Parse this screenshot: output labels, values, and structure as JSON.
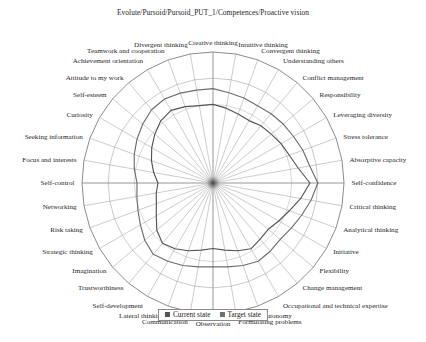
{
  "chart_title": "Evolute/Pursoid/Pursoid_PUT_1/Competences/Proactive vision",
  "legend": {
    "current_label": "Current state",
    "target_label": "Target state",
    "current_color": "#555555",
    "target_color": "#6e6e6e"
  },
  "colors": {
    "grid": "#8c8c8c",
    "spoke": "#909090",
    "outer_ring": "#6f6f6f",
    "axis_highlight": "#9a9a9a",
    "text": "#1b1b1b",
    "background": "#ffffff"
  },
  "chart_data": {
    "type": "radar",
    "title": "Evolute/Pursoid/Pursoid_PUT_1/Competences/Proactive vision",
    "xlabel": "",
    "ylabel": "",
    "rlim": [
      0,
      1
    ],
    "grid": true,
    "rings": 5,
    "legend_position": "bottom",
    "categories": [
      "Creative thinking",
      "Intuitive thinking",
      "Convergent thinking",
      "Understanding others",
      "Conflict management",
      "Responsibility",
      "Leveraging diversity",
      "Stress tolerance",
      "Absorptive capacity",
      "Self-confidence",
      "Critical thinking",
      "Analytical thinking",
      "Initiative",
      "Flexibility",
      "Change management",
      "Occupational and technical expertise",
      "Autonomy",
      "Formulating problems",
      "Observation",
      "Communication",
      "Lateral thinking",
      "Self-development",
      "Trustworthiness",
      "Imagination",
      "Strategic thinking",
      "Risk taking",
      "Networking",
      "Self-control",
      "Focus and interests",
      "Seeking information",
      "Curiosity",
      "Self-esteem",
      "Attitude to my work",
      "Achievement orientation",
      "Teamwork and cooperation",
      "Divergent thinking"
    ],
    "series": [
      {
        "name": "Current state",
        "color": "#555555",
        "values": [
          0.6,
          0.58,
          0.56,
          0.55,
          0.57,
          0.58,
          0.6,
          0.62,
          0.66,
          0.74,
          0.68,
          0.62,
          0.58,
          0.55,
          0.56,
          0.58,
          0.55,
          0.52,
          0.5,
          0.52,
          0.55,
          0.58,
          0.6,
          0.56,
          0.5,
          0.46,
          0.44,
          0.42,
          0.46,
          0.5,
          0.54,
          0.58,
          0.62,
          0.64,
          0.62,
          0.6
        ]
      },
      {
        "name": "Target state",
        "color": "#6e6e6e",
        "values": [
          0.72,
          0.7,
          0.69,
          0.68,
          0.69,
          0.7,
          0.71,
          0.73,
          0.75,
          0.8,
          0.76,
          0.72,
          0.69,
          0.67,
          0.68,
          0.69,
          0.67,
          0.65,
          0.64,
          0.65,
          0.67,
          0.69,
          0.71,
          0.68,
          0.64,
          0.61,
          0.59,
          0.58,
          0.61,
          0.64,
          0.67,
          0.7,
          0.73,
          0.74,
          0.73,
          0.72
        ]
      }
    ]
  }
}
